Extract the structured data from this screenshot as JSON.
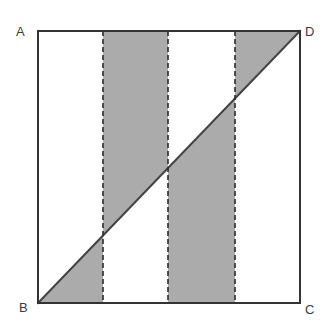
{
  "figure": {
    "type": "geometry-diagram",
    "canvas": {
      "width": 335,
      "height": 328,
      "background": "#ffffff"
    },
    "colors": {
      "shaded_fill": "#ababab",
      "outline": "#333333",
      "dashed_line": "#2b2b2b",
      "diagonal": "#444444",
      "label_text": "#3b3b3b",
      "background": "#ffffff"
    },
    "square": {
      "name": "ABCD",
      "left": 38,
      "top": 31,
      "right": 300,
      "bottom": 303,
      "width": 262,
      "height": 272,
      "stroke_width": 2
    },
    "vertices": [
      {
        "id": "A",
        "label": "A",
        "corner": "top-left",
        "x": 38,
        "y": 31
      },
      {
        "id": "D",
        "label": "D",
        "corner": "top-right",
        "x": 300,
        "y": 31
      },
      {
        "id": "B",
        "label": "B",
        "corner": "bottom-left",
        "x": 38,
        "y": 303
      },
      {
        "id": "C",
        "label": "C",
        "corner": "bottom-right",
        "x": 300,
        "y": 303
      }
    ],
    "diagonal": {
      "id": "BD",
      "from": "B",
      "to": "D",
      "x1": 38,
      "y1": 303,
      "x2": 300,
      "y2": 31,
      "stroke_width": 2
    },
    "dashed_lines": [
      {
        "id": "divider-1",
        "x": 103,
        "y_top": 31,
        "y_bottom": 303,
        "dash": "5 3"
      },
      {
        "id": "divider-2",
        "x": 168,
        "y_top": 31,
        "y_bottom": 303,
        "dash": "5 3"
      },
      {
        "id": "divider-3",
        "x": 235,
        "y_top": 31,
        "y_bottom": 303,
        "dash": "5 3"
      }
    ],
    "strips": [
      {
        "id": "strip-1",
        "index": 1,
        "x_left": 38,
        "x_right": 103,
        "shaded": true,
        "shaded_side": "below-diagonal",
        "points": "38,303 103,303 103,235.5"
      },
      {
        "id": "strip-2",
        "index": 2,
        "x_left": 103,
        "x_right": 168,
        "shaded": true,
        "shaded_side": "above-diagonal",
        "points": "103,31 168,31 168,166.0 103,235.5"
      },
      {
        "id": "strip-3",
        "index": 3,
        "x_left": 168,
        "x_right": 235,
        "shaded": true,
        "shaded_side": "below-diagonal",
        "points": "168,166.0 235,96.4 235,303 168,303"
      },
      {
        "id": "strip-4",
        "index": 4,
        "x_left": 235,
        "x_right": 300,
        "shaded": true,
        "shaded_side": "above-diagonal",
        "points": "235,31 300,31 235,96.4"
      }
    ]
  }
}
